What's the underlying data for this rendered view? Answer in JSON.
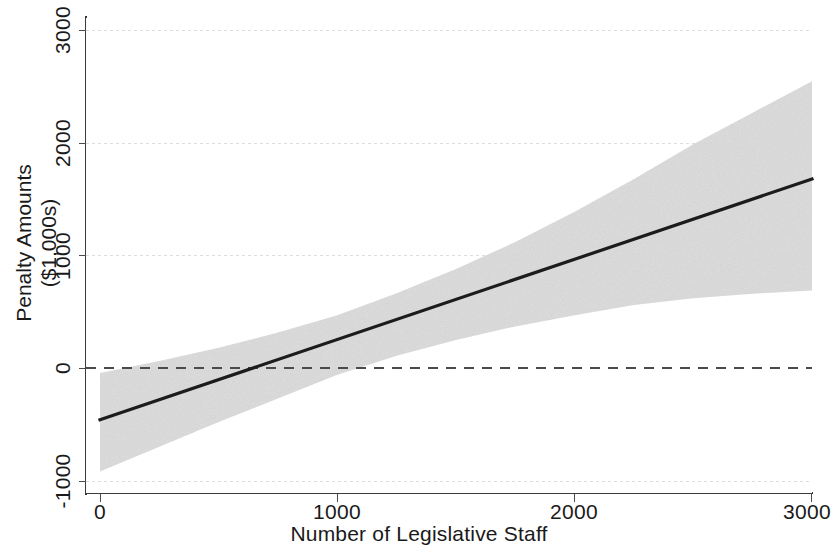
{
  "figure": {
    "background_color": "#ffffff",
    "line_color": "#1c1c1c",
    "band_color": "#d9d9d9",
    "grid_color": "#d8d8da",
    "zero_line_color": "#4a4a4a"
  },
  "axes": {
    "x_title": "Number of Legislative Staff",
    "y_title_line1": "Penalty Amounts",
    "y_title_line2": "($1,000s)",
    "x_ticks": [
      "0",
      "1000",
      "2000",
      "3000"
    ],
    "y_ticks": [
      "-1000",
      "0",
      "1000",
      "2000",
      "3000"
    ]
  },
  "chart_data": {
    "type": "line",
    "title": "",
    "subtitle": "",
    "xlabel": "Number of Legislative Staff",
    "ylabel": "Penalty Amounts ($1,000s)",
    "xlim": [
      0,
      3000
    ],
    "ylim": [
      -1000,
      3000
    ],
    "xticks": [
      0,
      1000,
      2000,
      3000
    ],
    "yticks": [
      -1000,
      0,
      1000,
      2000,
      3000
    ],
    "grid": true,
    "grid_style": "dotted-horizontal",
    "legend": null,
    "legend_position": "none",
    "annotations": [
      {
        "type": "reference_line",
        "orientation": "horizontal",
        "value": 0,
        "style": "dashed"
      }
    ],
    "series": [
      {
        "name": "Predicted penalty amount",
        "style": "solid-line",
        "x": [
          0,
          250,
          500,
          750,
          1000,
          1250,
          1500,
          1750,
          2000,
          2250,
          2500,
          2750,
          3000
        ],
        "values": [
          -460,
          -282,
          -103,
          75,
          254,
          432,
          611,
          789,
          968,
          1146,
          1325,
          1503,
          1680
        ]
      },
      {
        "name": "95% confidence interval - upper",
        "style": "band-edge",
        "x": [
          0,
          250,
          500,
          750,
          1000,
          1250,
          1500,
          1750,
          2000,
          2250,
          2500,
          2750,
          3000
        ],
        "values": [
          -45,
          62,
          180,
          315,
          470,
          665,
          880,
          1120,
          1390,
          1680,
          1990,
          2270,
          2550
        ]
      },
      {
        "name": "95% confidence interval - lower",
        "style": "band-edge",
        "x": [
          0,
          250,
          500,
          750,
          1000,
          1250,
          1500,
          1750,
          2000,
          2250,
          2500,
          2750,
          3000
        ],
        "values": [
          -920,
          -700,
          -480,
          -270,
          -60,
          110,
          250,
          370,
          470,
          560,
          620,
          660,
          690
        ]
      }
    ],
    "zero_crossing_x": 696
  }
}
